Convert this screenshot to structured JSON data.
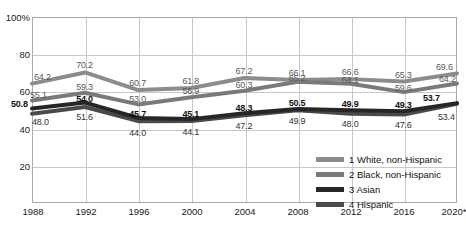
{
  "chart_data": {
    "type": "line",
    "title": "",
    "subtitle": "",
    "xlabel": "",
    "ylabel": "",
    "categories": [
      "1988",
      "1992",
      "1996",
      "2000",
      "2004",
      "2008",
      "2012",
      "2016",
      "2020*"
    ],
    "ylim": [
      0,
      100
    ],
    "yticks": [
      "20",
      "40",
      "60",
      "80",
      "100%"
    ],
    "ytick_values": [
      20,
      40,
      60,
      80,
      100
    ],
    "grid": true,
    "legend_position": "inside-lower-right",
    "series": [
      {
        "name": "1 White, non-Hispanic",
        "legend_label": "1 White, non-Hispanic",
        "color": "#8c8c8c",
        "values": [
          64.2,
          70.2,
          60.7,
          61.8,
          67.2,
          66.1,
          66.6,
          65.3,
          69.6
        ],
        "labels": [
          "64.2",
          "70.2",
          "60.7",
          "61.8",
          "67.2",
          "66.1",
          "66.6",
          "65.3",
          "69.6"
        ]
      },
      {
        "name": "2 Black, non-Hispanic",
        "legend_label": "2 Black, non-Hispanic",
        "color": "#7a7a7a",
        "values": [
          55.1,
          59.3,
          53.0,
          56.9,
          60.3,
          65.2,
          64.1,
          59.6,
          64.2
        ],
        "labels": [
          "55.1",
          "59.3",
          "53.0",
          "56.9",
          "60.3",
          "65.2",
          "64.1",
          "59.6",
          "64.2"
        ]
      },
      {
        "name": "3 Asian",
        "legend_label": "3 Asian",
        "color": "#262626",
        "values": [
          50.8,
          54.0,
          45.7,
          45.1,
          48.3,
          50.5,
          49.9,
          49.3,
          53.7
        ],
        "labels": [
          "50.8",
          "54.0",
          "45.7",
          "45.1",
          "48.3",
          "50.5",
          "49.9",
          "49.3",
          "53.7"
        ]
      },
      {
        "name": "4 Hispanic",
        "legend_label": "4 Hispanic",
        "color": "#4a4a4a",
        "values": [
          48.0,
          51.6,
          44.0,
          44.1,
          47.2,
          49.9,
          48.0,
          47.6,
          53.4
        ],
        "labels": [
          "48.0",
          "51.6",
          "44.0",
          "44.1",
          "47.2",
          "49.9",
          "48.0",
          "47.6",
          "53.4"
        ]
      }
    ]
  }
}
